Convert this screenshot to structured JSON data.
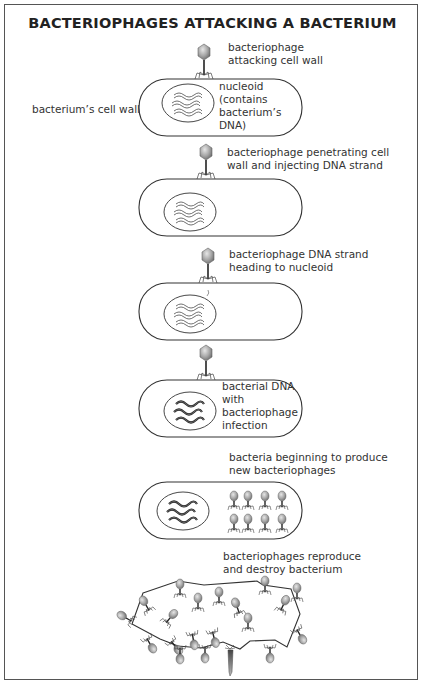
{
  "title": "BACTERIOPHAGES ATTACKING A BACTERIUM",
  "stages": [
    {
      "id": "stage-1",
      "caption": [
        "bacteriophage",
        "attacking cell wall"
      ],
      "side_label": "bacterium’s cell wall",
      "inner_label": [
        "nucleoid",
        "(contains",
        "bacterium’s",
        "DNA)"
      ]
    },
    {
      "id": "stage-2",
      "caption": [
        "bacteriophage penetrating cell",
        "wall and injecting DNA strand"
      ]
    },
    {
      "id": "stage-3",
      "caption": [
        "bacteriophage DNA strand",
        "heading to nucleoid"
      ]
    },
    {
      "id": "stage-4",
      "inner_label": [
        "bacterial DNA",
        "with",
        "bacteriophage",
        "infection"
      ]
    },
    {
      "id": "stage-5",
      "caption": [
        "bacteria beginning to produce",
        "new bacteriophages"
      ]
    },
    {
      "id": "stage-6",
      "caption": [
        "bacteriophages reproduce",
        "and destroy bacterium"
      ]
    }
  ],
  "colors": {
    "outline": "#333333",
    "phage_head": "#9a9a9a",
    "frame": "#555555"
  }
}
